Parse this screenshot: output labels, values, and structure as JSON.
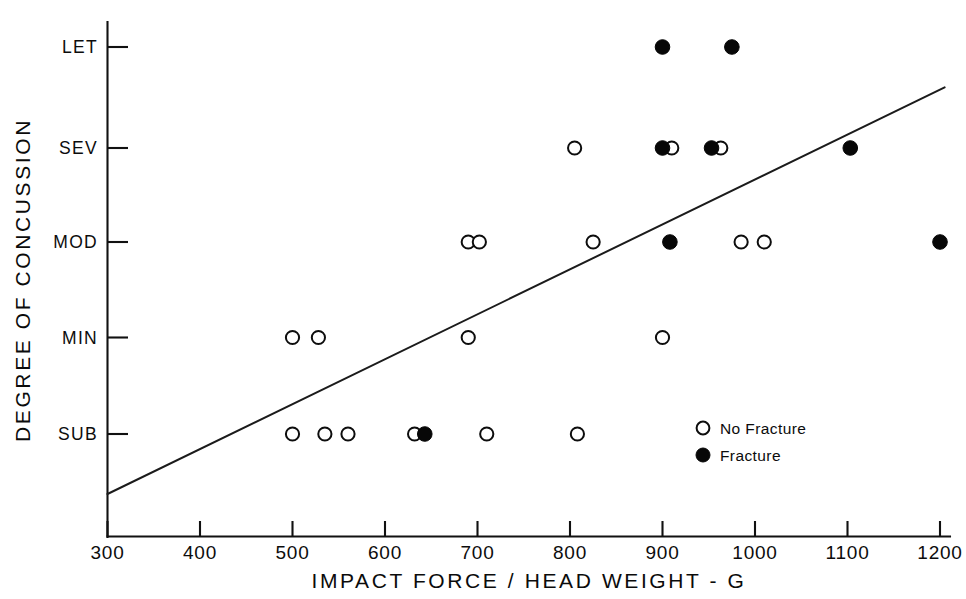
{
  "chart_data": {
    "type": "scatter",
    "title": "",
    "xlabel": "IMPACT FORCE / HEAD WEIGHT - G",
    "ylabel": "DEGREE OF CONCUSSION",
    "xlim": [
      300,
      1200
    ],
    "ylim": [
      0,
      5
    ],
    "grid": false,
    "x_ticks": [
      300,
      400,
      500,
      600,
      700,
      800,
      900,
      1000,
      1100,
      1200
    ],
    "x_tick_labels": [
      "300",
      "400",
      "500",
      "600",
      "700",
      "800",
      "900",
      "1000",
      "1100",
      "1200"
    ],
    "y_ticks": [
      1,
      2,
      3,
      4,
      5
    ],
    "y_tick_labels": [
      "SUB",
      "MIN",
      "MOD",
      "SEV",
      "LET"
    ],
    "legend_position": "inside-right-lower",
    "series": [
      {
        "name": "No Fracture",
        "marker": "open-circle",
        "points": [
          {
            "x": 805,
            "y": 4
          },
          {
            "x": 910,
            "y": 4
          },
          {
            "x": 963,
            "y": 4
          },
          {
            "x": 690,
            "y": 3
          },
          {
            "x": 702,
            "y": 3
          },
          {
            "x": 825,
            "y": 3
          },
          {
            "x": 985,
            "y": 3
          },
          {
            "x": 1010,
            "y": 3
          },
          {
            "x": 500,
            "y": 2
          },
          {
            "x": 528,
            "y": 2
          },
          {
            "x": 690,
            "y": 2
          },
          {
            "x": 900,
            "y": 2
          },
          {
            "x": 500,
            "y": 1
          },
          {
            "x": 535,
            "y": 1
          },
          {
            "x": 560,
            "y": 1
          },
          {
            "x": 632,
            "y": 1
          },
          {
            "x": 710,
            "y": 1
          },
          {
            "x": 808,
            "y": 1
          }
        ]
      },
      {
        "name": "Fracture",
        "marker": "filled-circle",
        "points": [
          {
            "x": 900,
            "y": 5
          },
          {
            "x": 975,
            "y": 5
          },
          {
            "x": 900,
            "y": 4
          },
          {
            "x": 953,
            "y": 4
          },
          {
            "x": 1103,
            "y": 4
          },
          {
            "x": 908,
            "y": 3
          },
          {
            "x": 1200,
            "y": 3
          },
          {
            "x": 643,
            "y": 1
          }
        ]
      }
    ],
    "trend_line": {
      "name": "regression-line",
      "x_start": 300,
      "y_start": 0.38,
      "x_end": 1205,
      "y_end": 4.6
    },
    "annotations": []
  },
  "legend": {
    "entries": [
      {
        "label": "No Fracture",
        "marker": "open-circle"
      },
      {
        "label": "Fracture",
        "marker": "filled-circle"
      }
    ]
  }
}
